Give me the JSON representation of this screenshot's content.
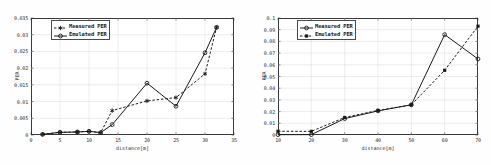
{
  "figure": {
    "background_color": "#ffffff",
    "line_color": "#1a1a1a",
    "grid_color": "#d8d8d8",
    "axis_color": "#3a3a3a"
  },
  "chart_data": [
    {
      "type": "line",
      "panel": "left",
      "title": "",
      "xlabel": "distance[m]",
      "ylabel": "PER",
      "xlim": [
        0,
        35
      ],
      "ylim": [
        0,
        0.035
      ],
      "xticks": [
        0,
        5,
        10,
        15,
        20,
        25,
        30,
        35
      ],
      "xtick_labels": [
        "0",
        "5",
        "10",
        "15",
        "20",
        "25",
        "30",
        "35"
      ],
      "yticks": [
        0,
        0.005,
        0.01,
        0.015,
        0.02,
        0.025,
        0.03,
        0.035
      ],
      "ytick_labels": [
        "0",
        "0.005",
        "0.01",
        "0.015",
        "0.02",
        "0.025",
        "0.03",
        "0.035"
      ],
      "grid": true,
      "legend_position": "top-left",
      "series": [
        {
          "name": "Measured PER",
          "style": "dashed",
          "marker": "star",
          "x": [
            2,
            5,
            8,
            10,
            12,
            14,
            20,
            25,
            30,
            32
          ],
          "y": [
            0.0002,
            0.0008,
            0.0009,
            0.0011,
            0.0007,
            0.0073,
            0.0102,
            0.0112,
            0.0183,
            0.0322
          ]
        },
        {
          "name": "Emulated PER",
          "style": "solid",
          "marker": "circle",
          "x": [
            2,
            5,
            8,
            10,
            12,
            14,
            20,
            25,
            30,
            32
          ],
          "y": [
            0.0002,
            0.0008,
            0.0009,
            0.0011,
            0.0007,
            0.0031,
            0.0155,
            0.0086,
            0.0246,
            0.0322
          ]
        }
      ]
    },
    {
      "type": "line",
      "panel": "right",
      "title": "",
      "xlabel": "distance[m]",
      "ylabel": "PER",
      "xlim": [
        10,
        70
      ],
      "ylim": [
        0,
        0.1
      ],
      "xticks": [
        10,
        20,
        30,
        40,
        50,
        60,
        70
      ],
      "xtick_labels": [
        "10",
        "20",
        "30",
        "40",
        "50",
        "60",
        "70"
      ],
      "yticks": [
        0,
        0.01,
        0.02,
        0.03,
        0.04,
        0.05,
        0.06,
        0.07,
        0.08,
        0.09,
        0.1
      ],
      "ytick_labels": [
        "0",
        "0.01",
        "0.02",
        "0.03",
        "0.04",
        "0.05",
        "0.06",
        "0.07",
        "0.08",
        "0.09",
        "0.1"
      ],
      "grid": true,
      "legend_position": "top-left",
      "series": [
        {
          "name": "Measured PER",
          "style": "solid",
          "marker": "circle",
          "x": [
            10,
            20,
            30,
            40,
            50,
            60,
            70
          ],
          "y": [
            0.0003,
            0.0003,
            0.014,
            0.0206,
            0.0258,
            0.0858,
            0.065
          ]
        },
        {
          "name": "Emulated PER",
          "style": "dashed",
          "marker": "square",
          "x": [
            10,
            20,
            30,
            40,
            50,
            60,
            70
          ],
          "y": [
            0.0032,
            0.0031,
            0.015,
            0.021,
            0.0258,
            0.0553,
            0.093
          ]
        }
      ]
    }
  ]
}
